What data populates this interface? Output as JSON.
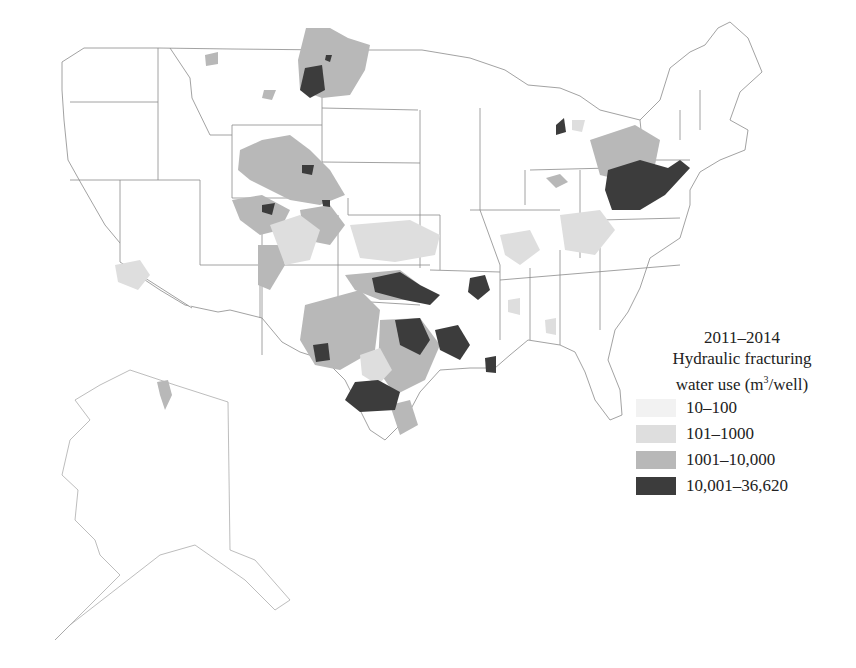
{
  "legend": {
    "title_line1": "2011–2014",
    "title_line2": "Hydraulic fracturing",
    "title_line3_prefix": "water use (m",
    "title_line3_sup": "3",
    "title_line3_suffix": "/well)",
    "items": [
      {
        "label": "10–100",
        "color": "#f2f2f2"
      },
      {
        "label": "101–1000",
        "color": "#dedede"
      },
      {
        "label": "1001–10,000",
        "color": "#b8b8b8"
      },
      {
        "label": "10,001–36,620",
        "color": "#3c3c3c"
      }
    ]
  },
  "map": {
    "region": "United States (contiguous + Alaska)",
    "stroke_color": "#8a8a8a",
    "background": "#ffffff"
  }
}
